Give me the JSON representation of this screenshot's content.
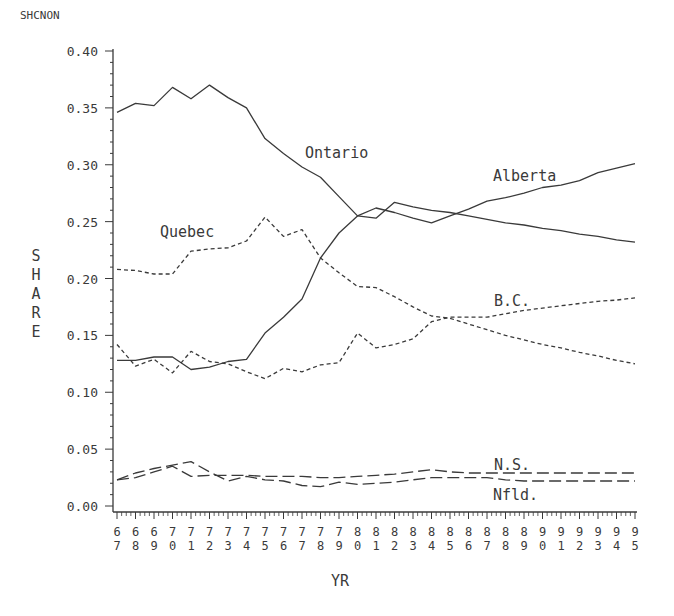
{
  "chart_data": {
    "type": "line",
    "title": "",
    "corner_label": "SHCNON",
    "xlabel": "YR",
    "ylabel": "SHARE",
    "ylim": [
      0.0,
      0.4
    ],
    "yticks": [
      "0.00",
      "0.05",
      "0.10",
      "0.15",
      "0.20",
      "0.25",
      "0.30",
      "0.35",
      "0.40"
    ],
    "grid": false,
    "legend": "inline labels",
    "x": [
      67,
      68,
      69,
      70,
      71,
      72,
      73,
      74,
      75,
      76,
      77,
      78,
      79,
      80,
      81,
      82,
      83,
      84,
      85,
      86,
      87,
      88,
      89,
      90,
      91,
      92,
      93,
      94,
      95
    ],
    "x_tick_labels": [
      "67",
      "68",
      "69",
      "70",
      "71",
      "72",
      "73",
      "74",
      "75",
      "76",
      "77",
      "78",
      "79",
      "80",
      "81",
      "82",
      "83",
      "84",
      "85",
      "86",
      "87",
      "88",
      "89",
      "90",
      "91",
      "92",
      "93",
      "94",
      "95"
    ],
    "series": [
      {
        "name": "Ontario",
        "style": "solid",
        "values": [
          0.346,
          0.354,
          0.352,
          0.368,
          0.358,
          0.37,
          0.359,
          0.35,
          0.323,
          0.31,
          0.298,
          0.289,
          0.272,
          0.255,
          0.253,
          0.267,
          0.263,
          0.26,
          0.258,
          0.255,
          0.252,
          0.249,
          0.247,
          0.244,
          0.242,
          0.239,
          0.237,
          0.234,
          0.232
        ]
      },
      {
        "name": "Alberta",
        "style": "solid",
        "values": [
          0.128,
          0.128,
          0.131,
          0.131,
          0.12,
          0.122,
          0.127,
          0.129,
          0.152,
          0.166,
          0.182,
          0.218,
          0.24,
          0.255,
          0.262,
          0.258,
          0.253,
          0.249,
          0.255,
          0.261,
          0.268,
          0.271,
          0.275,
          0.28,
          0.282,
          0.286,
          0.293,
          0.297,
          0.301
        ]
      },
      {
        "name": "Quebec",
        "style": "dashed",
        "values": [
          0.208,
          0.207,
          0.204,
          0.204,
          0.224,
          0.226,
          0.227,
          0.233,
          0.254,
          0.237,
          0.243,
          0.218,
          0.205,
          0.193,
          0.192,
          0.184,
          0.175,
          0.167,
          0.165,
          0.16,
          0.155,
          0.15,
          0.146,
          0.142,
          0.139,
          0.135,
          0.132,
          0.128,
          0.125
        ]
      },
      {
        "name": "B.C.",
        "style": "dashed",
        "values": [
          0.142,
          0.123,
          0.129,
          0.117,
          0.136,
          0.127,
          0.125,
          0.118,
          0.112,
          0.121,
          0.118,
          0.124,
          0.126,
          0.152,
          0.139,
          0.142,
          0.147,
          0.162,
          0.166,
          0.166,
          0.166,
          0.169,
          0.172,
          0.174,
          0.176,
          0.178,
          0.18,
          0.181,
          0.183
        ]
      },
      {
        "name": "N.S.",
        "style": "longdash",
        "values": [
          0.023,
          0.025,
          0.03,
          0.035,
          0.026,
          0.027,
          0.027,
          0.027,
          0.026,
          0.026,
          0.026,
          0.025,
          0.025,
          0.026,
          0.027,
          0.028,
          0.03,
          0.032,
          0.03,
          0.029,
          0.029,
          0.029,
          0.029,
          0.029,
          0.029,
          0.029,
          0.029,
          0.029,
          0.029
        ]
      },
      {
        "name": "Nfld.",
        "style": "longdash",
        "values": [
          0.023,
          0.029,
          0.033,
          0.036,
          0.039,
          0.03,
          0.022,
          0.026,
          0.023,
          0.022,
          0.018,
          0.017,
          0.021,
          0.019,
          0.02,
          0.021,
          0.023,
          0.025,
          0.025,
          0.025,
          0.025,
          0.023,
          0.022,
          0.022,
          0.022,
          0.022,
          0.022,
          0.022,
          0.022
        ]
      }
    ],
    "annotations": [
      {
        "text": "Ontario",
        "x": 305,
        "y": 158
      },
      {
        "text": "Alberta",
        "x": 493,
        "y": 181
      },
      {
        "text": "Quebec",
        "x": 160,
        "y": 237
      },
      {
        "text": "B.C.",
        "x": 494,
        "y": 306
      },
      {
        "text": "N.S.",
        "x": 494,
        "y": 470
      },
      {
        "text": "Nfld.",
        "x": 493,
        "y": 500
      }
    ]
  },
  "colors": {
    "line": "#3a3a3a",
    "text": "#3a3a3a",
    "background": "#ffffff"
  }
}
